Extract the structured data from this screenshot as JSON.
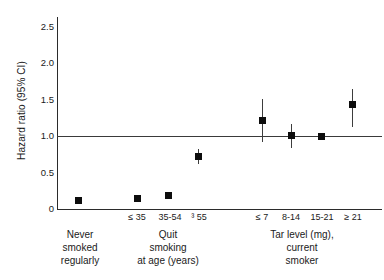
{
  "chart_data": {
    "type": "scatter",
    "title": "",
    "xlabel": "",
    "ylabel": "Hazard ratio (95% CI)",
    "ylim": [
      0,
      2.75
    ],
    "yticks": [
      "0",
      "0.5",
      "1.0",
      "1.5",
      "2.0",
      "2.5"
    ],
    "ytick_values": [
      0,
      0.5,
      1.0,
      1.5,
      2.0,
      2.5
    ],
    "grid": false,
    "legend": "none",
    "reference_line": 1.0,
    "categories": [
      "",
      "≤ 35",
      "35-54",
      "³ 55",
      "≤ 7",
      "8-14",
      "15-21",
      "≥ 21"
    ],
    "values": [
      0.06,
      0.15,
      0.2,
      0.72,
      1.17,
      1.01,
      1.0,
      1.45
    ],
    "ci_low": [
      null,
      null,
      null,
      0.62,
      0.93,
      0.84,
      null,
      1.14
    ],
    "ci_high": [
      null,
      null,
      null,
      0.82,
      1.51,
      1.2,
      null,
      1.66
    ],
    "groups": [
      {
        "label_lines": [
          "Never",
          "smoked",
          "regularly"
        ],
        "points": [
          {
            "category": "",
            "value": 0.06
          }
        ]
      },
      {
        "label_lines": [
          "Quit",
          "smoking",
          "at age (years)"
        ],
        "points": [
          {
            "category": "≤ 35",
            "value": 0.15
          },
          {
            "category": "35-54",
            "value": 0.2
          },
          {
            "category": "³ 55",
            "value": 0.72,
            "ci_low": 0.62,
            "ci_high": 0.82
          }
        ]
      },
      {
        "label_lines": [
          "Tar level (mg),",
          "current",
          "smoker"
        ],
        "points": [
          {
            "category": "≤ 7",
            "value": 1.17,
            "ci_low": 0.93,
            "ci_high": 1.51
          },
          {
            "category": "8-14",
            "value": 1.01,
            "ci_low": 0.84,
            "ci_high": 1.2
          },
          {
            "category": "15-21",
            "value": 1.0
          },
          {
            "category": "≥ 21",
            "value": 1.45,
            "ci_low": 1.14,
            "ci_high": 1.66
          }
        ]
      }
    ],
    "marker_color": "#0d0d0d",
    "axis_color": "#2b2b2b"
  },
  "axis": {
    "y_title": "Hazard ratio (95% CI)",
    "ticks": [
      {
        "label": "2.5",
        "top": 22
      },
      {
        "label": "2.0",
        "top": 58
      },
      {
        "label": "1.5",
        "top": 95
      },
      {
        "label": "1.0",
        "top": 131
      },
      {
        "label": "0.5",
        "top": 168
      },
      {
        "label": "0",
        "top": 204
      }
    ]
  },
  "points": [
    {
      "name": "never-smoked-regularly",
      "x": 78,
      "y": 200,
      "err_top": null,
      "err_bottom": null
    },
    {
      "name": "quit-at-35-or-less",
      "x": 137,
      "y": 198,
      "err_top": null,
      "err_bottom": null
    },
    {
      "name": "quit-at-35-54",
      "x": 168,
      "y": 195,
      "err_top": null,
      "err_bottom": null
    },
    {
      "name": "quit-at-55-or-more",
      "x": 198,
      "y": 156,
      "err_top": 149,
      "err_bottom": 164
    },
    {
      "name": "tar-7-or-less",
      "x": 262,
      "y": 120,
      "err_top": 99,
      "err_bottom": 142
    },
    {
      "name": "tar-8-14",
      "x": 291,
      "y": 135,
      "err_top": 124,
      "err_bottom": 148
    },
    {
      "name": "tar-15-21",
      "x": 321,
      "y": 136,
      "err_top": null,
      "err_bottom": null
    },
    {
      "name": "tar-21-or-more",
      "x": 352,
      "y": 104,
      "err_top": 89,
      "err_bottom": 127
    }
  ],
  "x_tick_labels": [
    {
      "name": "tick-quit-le-35",
      "text": "≤ 35",
      "left": 120,
      "width": 34
    },
    {
      "name": "tick-quit-35-54",
      "text": "35-54",
      "left": 151,
      "width": 38
    },
    {
      "name": "tick-quit-ge-55",
      "text": "³ 55",
      "left": 183,
      "width": 32
    },
    {
      "name": "tick-tar-le-7",
      "text": "≤ 7",
      "left": 247,
      "width": 30
    },
    {
      "name": "tick-tar-8-14",
      "text": "8-14",
      "left": 275,
      "width": 32
    },
    {
      "name": "tick-tar-15-21",
      "text": "15-21",
      "left": 305,
      "width": 34
    },
    {
      "name": "tick-tar-ge-21",
      "text": "≥ 21",
      "left": 337,
      "width": 32
    }
  ],
  "group_labels": [
    {
      "name": "group-label-never-smoked",
      "left": 47,
      "top": 228,
      "width": 66,
      "lines": [
        "Never",
        "smoked",
        "regularly"
      ]
    },
    {
      "name": "group-label-quit-smoking",
      "left": 118,
      "top": 228,
      "width": 100,
      "lines": [
        "Quit",
        "smoking",
        "at age (years)"
      ]
    },
    {
      "name": "group-label-tar-level",
      "left": 252,
      "top": 228,
      "width": 100,
      "lines": [
        "Tar level (mg),",
        "current",
        "smoker"
      ]
    }
  ]
}
